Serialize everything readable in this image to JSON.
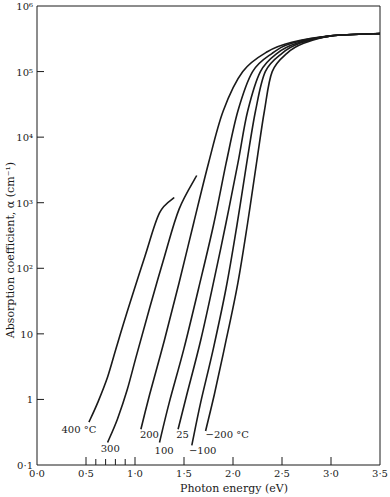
{
  "chart_data": {
    "type": "line",
    "title": "",
    "xlabel": "Photon energy (eV)",
    "ylabel": "Absorption coefficient, α (cm⁻¹)",
    "xlim": [
      0.0,
      3.5
    ],
    "ylim": [
      0.1,
      1000000
    ],
    "yscale": "log",
    "grid": false,
    "legend": "inline labels at lower ends of curves",
    "x_ticks": [
      {
        "value": 0.0,
        "label": "0·0"
      },
      {
        "value": 0.5,
        "label": "0·5"
      },
      {
        "value": 1.0,
        "label": "1·0"
      },
      {
        "value": 1.5,
        "label": "1·5"
      },
      {
        "value": 2.0,
        "label": "2·0"
      },
      {
        "value": 2.5,
        "label": "2·5"
      },
      {
        "value": 3.0,
        "label": "3·0"
      },
      {
        "value": 3.5,
        "label": "3·5"
      }
    ],
    "x_minor_ticks": [
      0.6,
      0.7,
      0.8,
      0.9
    ],
    "y_ticks": [
      {
        "value": 0.1,
        "label": "0·1"
      },
      {
        "value": 1,
        "label": "1"
      },
      {
        "value": 10,
        "label": "10"
      },
      {
        "value": 100,
        "label": "10²"
      },
      {
        "value": 1000,
        "label": "10³"
      },
      {
        "value": 10000,
        "label": "10⁴"
      },
      {
        "value": 100000,
        "label": "10⁵"
      },
      {
        "value": 1000000,
        "label": "10⁶"
      }
    ],
    "series": [
      {
        "name": "400 °C",
        "label": "400 °C",
        "label_pos": [
          0.25,
          0.35
        ],
        "points": [
          [
            0.53,
            0.45
          ],
          [
            0.62,
            0.9
          ],
          [
            0.72,
            2.2
          ],
          [
            0.82,
            7
          ],
          [
            0.95,
            30
          ],
          [
            1.1,
            150
          ],
          [
            1.25,
            700
          ],
          [
            1.4,
            1200
          ]
        ]
      },
      {
        "name": "300 °C",
        "label": "300",
        "label_pos": [
          0.65,
          0.18
        ],
        "points": [
          [
            0.72,
            0.22
          ],
          [
            0.82,
            0.5
          ],
          [
            0.92,
            1.4
          ],
          [
            1.02,
            5
          ],
          [
            1.15,
            25
          ],
          [
            1.3,
            150
          ],
          [
            1.45,
            800
          ],
          [
            1.63,
            2600
          ]
        ]
      },
      {
        "name": "200 °C",
        "label": "200",
        "label_pos": [
          1.05,
          0.3
        ],
        "points": [
          [
            1.06,
            0.35
          ],
          [
            1.15,
            1.2
          ],
          [
            1.3,
            8
          ],
          [
            1.45,
            60
          ],
          [
            1.6,
            500
          ],
          [
            1.75,
            4000
          ],
          [
            1.9,
            25000
          ],
          [
            2.1,
            100000
          ],
          [
            2.35,
            200000
          ],
          [
            2.6,
            280000
          ],
          [
            3.0,
            350000
          ],
          [
            3.5,
            380000
          ]
        ]
      },
      {
        "name": "100 °C",
        "label": "100",
        "label_pos": [
          1.2,
          0.17
        ],
        "points": [
          [
            1.25,
            0.22
          ],
          [
            1.35,
            0.9
          ],
          [
            1.5,
            6
          ],
          [
            1.65,
            50
          ],
          [
            1.8,
            450
          ],
          [
            1.93,
            4000
          ],
          [
            2.05,
            25000
          ],
          [
            2.2,
            100000
          ],
          [
            2.4,
            190000
          ],
          [
            2.6,
            270000
          ],
          [
            3.0,
            350000
          ],
          [
            3.5,
            380000
          ]
        ]
      },
      {
        "name": "25 °C",
        "label": "25",
        "label_pos": [
          1.42,
          0.3
        ],
        "points": [
          [
            1.44,
            0.35
          ],
          [
            1.53,
            1.2
          ],
          [
            1.67,
            8
          ],
          [
            1.8,
            60
          ],
          [
            1.93,
            500
          ],
          [
            2.05,
            4000
          ],
          [
            2.15,
            25000
          ],
          [
            2.28,
            100000
          ],
          [
            2.45,
            190000
          ],
          [
            2.65,
            270000
          ],
          [
            3.0,
            350000
          ],
          [
            3.5,
            380000
          ]
        ]
      },
      {
        "name": "-100 °C",
        "label": "−100",
        "label_pos": [
          1.55,
          0.17
        ],
        "points": [
          [
            1.58,
            0.2
          ],
          [
            1.67,
            0.9
          ],
          [
            1.8,
            6
          ],
          [
            1.93,
            50
          ],
          [
            2.04,
            450
          ],
          [
            2.14,
            4000
          ],
          [
            2.23,
            25000
          ],
          [
            2.33,
            100000
          ],
          [
            2.5,
            190000
          ],
          [
            2.68,
            270000
          ],
          [
            3.0,
            350000
          ],
          [
            3.5,
            380000
          ]
        ]
      },
      {
        "name": "-200 °C",
        "label": "−200 °C",
        "label_pos": [
          1.72,
          0.3
        ],
        "points": [
          [
            1.72,
            0.33
          ],
          [
            1.81,
            1.2
          ],
          [
            1.93,
            8
          ],
          [
            2.05,
            60
          ],
          [
            2.15,
            500
          ],
          [
            2.24,
            4000
          ],
          [
            2.32,
            25000
          ],
          [
            2.4,
            100000
          ],
          [
            2.55,
            190000
          ],
          [
            2.72,
            270000
          ],
          [
            3.0,
            350000
          ],
          [
            3.5,
            380000
          ]
        ]
      }
    ]
  },
  "colors": {
    "background": "#ffffff",
    "ink": "#1a1a1a"
  }
}
